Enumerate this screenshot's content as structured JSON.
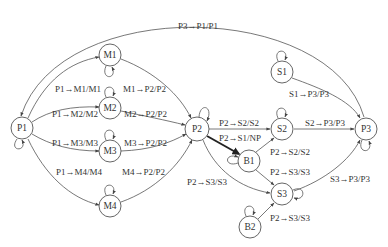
{
  "diagram": {
    "type": "state-transition-graph",
    "nodes": [
      {
        "id": "P1",
        "label": "P1",
        "x": 22,
        "y": 128
      },
      {
        "id": "M1",
        "label": "M1",
        "x": 110,
        "y": 55
      },
      {
        "id": "M2",
        "label": "M2",
        "x": 110,
        "y": 108
      },
      {
        "id": "M3",
        "label": "M3",
        "x": 110,
        "y": 151
      },
      {
        "id": "M4",
        "label": "M4",
        "x": 110,
        "y": 206
      },
      {
        "id": "P2",
        "label": "P2",
        "x": 197,
        "y": 129
      },
      {
        "id": "B1",
        "label": "B1",
        "x": 249,
        "y": 161
      },
      {
        "id": "B2",
        "label": "B2",
        "x": 250,
        "y": 227
      },
      {
        "id": "S1",
        "label": "S1",
        "x": 282,
        "y": 72
      },
      {
        "id": "S2",
        "label": "S2",
        "x": 282,
        "y": 129
      },
      {
        "id": "S3",
        "label": "S3",
        "x": 282,
        "y": 194
      },
      {
        "id": "P3",
        "label": "P3",
        "x": 366,
        "y": 129
      }
    ],
    "edges": [
      {
        "from": "P3",
        "to": "P1",
        "label": "P3→P1/P1"
      },
      {
        "from": "P1",
        "to": "M1",
        "label": "P1→M1/M1"
      },
      {
        "from": "P1",
        "to": "M2",
        "label": "P1→M2/M2"
      },
      {
        "from": "P1",
        "to": "M3",
        "label": "P1→M3/M3"
      },
      {
        "from": "P1",
        "to": "M4",
        "label": "P1→M4/M4"
      },
      {
        "from": "M1",
        "to": "P2",
        "label": "M1→P2/P2"
      },
      {
        "from": "M2",
        "to": "P2",
        "label": "M2→P2/P2"
      },
      {
        "from": "M3",
        "to": "P2",
        "label": "M3→P2/P2"
      },
      {
        "from": "M4",
        "to": "P2",
        "label": "M4→P2/P2"
      },
      {
        "from": "P2",
        "to": "S2",
        "label": "P2→S2/S2"
      },
      {
        "from": "P2",
        "to": "B1",
        "label": "P2→S1/NP",
        "bold": true
      },
      {
        "from": "P2",
        "to": "S3",
        "label": "P2→S3/S3"
      },
      {
        "from": "B1",
        "to": "S2",
        "label": "P2→S2/S2"
      },
      {
        "from": "B1",
        "to": "S3",
        "label": "P2→S3/S3"
      },
      {
        "from": "B2",
        "to": "S3",
        "label": "P2→S3/S3"
      },
      {
        "from": "S1",
        "to": "P3",
        "label": "S1→P3/P3"
      },
      {
        "from": "S2",
        "to": "P3",
        "label": "S2→P3/P3"
      },
      {
        "from": "S3",
        "to": "P3",
        "label": "S3→P3/P3"
      }
    ],
    "self_loops": [
      "P1",
      "M1",
      "M2",
      "M3",
      "M4",
      "P2",
      "B1",
      "B2",
      "S1",
      "S2",
      "S3",
      "P3"
    ]
  },
  "labels": {
    "p3_p1": "P3→P1/P1",
    "p1_m1": "P1→M1/M1",
    "p1_m2": "P1→M2/M2",
    "p1_m3": "P1→M3/M3",
    "p1_m4": "P1→M4/M4",
    "m1_p2": "M1→P2/P2",
    "m2_p2": "M2→P2/P2",
    "m3_p2": "M3→P2/P2",
    "m4_p2": "M4→P2/P2",
    "p2_s2": "P2→S2/S2",
    "p2_s1np": "P2→S1/NP",
    "p2_s3": "P2→S3/S3",
    "b1_s2": "P2→S2/S2",
    "b1_s3": "P2→S3/S3",
    "b2_s3": "P2→S3/S3",
    "s1_p3": "S1→P3/P3",
    "s2_p3": "S2→P3/P3",
    "s3_p3": "S3→P3/P3"
  },
  "node_labels": {
    "P1": "P1",
    "M1": "M1",
    "M2": "M2",
    "M3": "M3",
    "M4": "M4",
    "P2": "P2",
    "B1": "B1",
    "B2": "B2",
    "S1": "S1",
    "S2": "S2",
    "S3": "S3",
    "P3": "P3"
  }
}
